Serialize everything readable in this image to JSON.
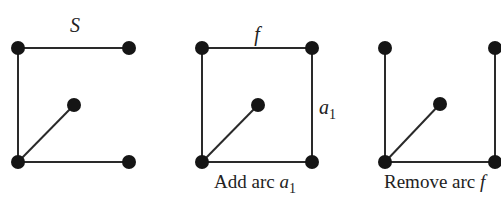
{
  "diagram": {
    "colors": {
      "node": "#151515",
      "edge": "#2a2a2a",
      "text": "#222222",
      "background": "#ffffff"
    },
    "panels": [
      {
        "id": "S",
        "top_label": "S",
        "caption": "",
        "nodes": [
          {
            "id": "tl",
            "x": 18,
            "y": 48
          },
          {
            "id": "tr",
            "x": 129,
            "y": 48
          },
          {
            "id": "mid",
            "x": 74,
            "y": 105
          },
          {
            "id": "bl",
            "x": 18,
            "y": 162
          },
          {
            "id": "br",
            "x": 129,
            "y": 162
          }
        ],
        "edges": [
          [
            "tl",
            "tr"
          ],
          [
            "tl",
            "bl"
          ],
          [
            "bl",
            "mid"
          ],
          [
            "bl",
            "br"
          ]
        ]
      },
      {
        "id": "add",
        "top_label": "f",
        "side_label": "a",
        "side_label_sub": "1",
        "caption": "Add arc ",
        "caption_var": "a",
        "caption_sub": "1",
        "nodes": [
          {
            "id": "tl",
            "x": 202,
            "y": 48
          },
          {
            "id": "tr",
            "x": 312,
            "y": 48
          },
          {
            "id": "mid",
            "x": 258,
            "y": 105
          },
          {
            "id": "bl",
            "x": 202,
            "y": 162
          },
          {
            "id": "br",
            "x": 312,
            "y": 162
          }
        ],
        "edges": [
          [
            "tl",
            "tr"
          ],
          [
            "tl",
            "bl"
          ],
          [
            "bl",
            "mid"
          ],
          [
            "bl",
            "br"
          ],
          [
            "tr",
            "br"
          ]
        ]
      },
      {
        "id": "remove",
        "caption": "Remove arc ",
        "caption_var": "f",
        "nodes": [
          {
            "id": "tl",
            "x": 385,
            "y": 48
          },
          {
            "id": "tr",
            "x": 495,
            "y": 48
          },
          {
            "id": "mid",
            "x": 440,
            "y": 104
          },
          {
            "id": "bl",
            "x": 385,
            "y": 162
          },
          {
            "id": "br",
            "x": 495,
            "y": 162
          }
        ],
        "edges": [
          [
            "tl",
            "bl"
          ],
          [
            "bl",
            "mid"
          ],
          [
            "bl",
            "br"
          ],
          [
            "tr",
            "br"
          ]
        ]
      }
    ]
  }
}
